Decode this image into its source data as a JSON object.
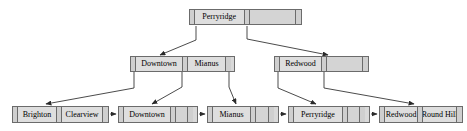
{
  "diagram": {
    "type": "b-plus-tree",
    "width": 467,
    "height": 131,
    "colors": {
      "node_fill": "#d9d9d9",
      "key_fill": "#dedede",
      "pointer_fill": "#cfcfcf",
      "border": "#6b6b6b",
      "edge": "#333333",
      "background": "#ffffff"
    }
  },
  "levels": {
    "root_label": "root",
    "internal_label": "internal",
    "leaf_label": "leaf"
  },
  "nodes": {
    "root": {
      "id": "root",
      "level": "root",
      "x": 189,
      "y": 9,
      "width": 113,
      "height": 16,
      "cells": [
        {
          "kind": "ptr",
          "text": ""
        },
        {
          "kind": "key",
          "text": "Perryridge",
          "width": 50
        },
        {
          "kind": "ptr",
          "text": ""
        },
        {
          "kind": "empty",
          "text": "",
          "width": 47
        },
        {
          "kind": "ptr",
          "text": ""
        }
      ]
    },
    "internal_left": {
      "id": "internal_left",
      "level": "internal",
      "x": 130,
      "y": 56,
      "width": 105,
      "height": 16,
      "cells": [
        {
          "kind": "ptr",
          "text": ""
        },
        {
          "kind": "key",
          "text": "Downtown",
          "width": 47
        },
        {
          "kind": "ptr",
          "text": ""
        },
        {
          "kind": "key",
          "text": "Mianus",
          "width": 38
        },
        {
          "kind": "ptr",
          "text": ""
        }
      ]
    },
    "internal_right": {
      "id": "internal_right",
      "level": "internal",
      "x": 274,
      "y": 56,
      "width": 95,
      "height": 16,
      "cells": [
        {
          "kind": "ptr",
          "text": ""
        },
        {
          "kind": "key",
          "text": "Redwood",
          "width": 43
        },
        {
          "kind": "ptr",
          "text": ""
        },
        {
          "kind": "empty",
          "text": "",
          "width": 37
        },
        {
          "kind": "ptr",
          "text": ""
        }
      ]
    },
    "leaf1": {
      "id": "leaf1",
      "level": "leaf",
      "x": 12,
      "y": 106,
      "width": 97,
      "height": 17,
      "cells": [
        {
          "kind": "ptr",
          "text": ""
        },
        {
          "kind": "key",
          "text": "Brighton",
          "width": 40
        },
        {
          "kind": "ptr",
          "text": ""
        },
        {
          "kind": "key",
          "text": "Clearview",
          "width": 42
        },
        {
          "kind": "ptr",
          "text": ""
        }
      ]
    },
    "leaf2": {
      "id": "leaf2",
      "level": "leaf",
      "x": 118,
      "y": 106,
      "width": 80,
      "height": 17,
      "cells": [
        {
          "kind": "ptr",
          "text": ""
        },
        {
          "kind": "key",
          "text": "Downtown",
          "width": 47
        },
        {
          "kind": "ptr",
          "text": ""
        },
        {
          "kind": "blank",
          "text": "",
          "width": 12
        },
        {
          "kind": "ptr",
          "text": ""
        }
      ]
    },
    "leaf3": {
      "id": "leaf3",
      "level": "leaf",
      "x": 207,
      "y": 106,
      "width": 72,
      "height": 17,
      "cells": [
        {
          "kind": "ptr",
          "text": ""
        },
        {
          "kind": "key",
          "text": "Mianus",
          "width": 38
        },
        {
          "kind": "ptr",
          "text": ""
        },
        {
          "kind": "blank",
          "text": "",
          "width": 13
        },
        {
          "kind": "ptr",
          "text": ""
        }
      ]
    },
    "leaf4": {
      "id": "leaf4",
      "level": "leaf",
      "x": 288,
      "y": 106,
      "width": 82,
      "height": 17,
      "cells": [
        {
          "kind": "ptr",
          "text": ""
        },
        {
          "kind": "key",
          "text": "Perryridge",
          "width": 49
        },
        {
          "kind": "ptr",
          "text": ""
        },
        {
          "kind": "blank",
          "text": "",
          "width": 12
        },
        {
          "kind": "ptr",
          "text": ""
        }
      ]
    },
    "leaf5": {
      "id": "leaf5",
      "level": "leaf",
      "x": 379,
      "y": 106,
      "width": 84,
      "height": 17,
      "cells": [
        {
          "kind": "ptr",
          "text": ""
        },
        {
          "kind": "key",
          "text": "Redwood",
          "width": 42
        },
        {
          "kind": "ptr",
          "text": ""
        },
        {
          "kind": "key",
          "text": "Round Hill",
          "width": 43
        },
        {
          "kind": "ptr",
          "text": ""
        }
      ]
    }
  },
  "edges": [
    {
      "name": "root-to-internal-left",
      "from": "root",
      "to": "internal_left",
      "path": "M 196 26 L 196 40 L 160 55",
      "arrow": [
        160,
        55,
        -68
      ]
    },
    {
      "name": "root-to-internal-right",
      "from": "root",
      "to": "internal_right",
      "path": "M 247 26 L 247 39 L 328 55",
      "arrow": [
        328,
        55,
        45
      ]
    },
    {
      "name": "internal-left-to-leaf1",
      "from": "internal_left",
      "to": "leaf1",
      "path": "M 134 72 L 134 88 L 46 104",
      "arrow": [
        46,
        104,
        -170
      ]
    },
    {
      "name": "internal-left-to-leaf2",
      "from": "internal_left",
      "to": "leaf2",
      "path": "M 182 72 L 182 87 L 152 104",
      "arrow": [
        152,
        104,
        -62
      ]
    },
    {
      "name": "internal-left-to-leaf3",
      "from": "internal_left",
      "to": "leaf3",
      "path": "M 229 72 L 229 87 L 236 104",
      "arrow": [
        236,
        104,
        14
      ]
    },
    {
      "name": "internal-right-to-leaf4",
      "from": "internal_right",
      "to": "leaf4",
      "path": "M 278 72 L 278 88 L 316 104",
      "arrow": [
        316,
        104,
        38
      ]
    },
    {
      "name": "internal-right-to-leaf5",
      "from": "internal_right",
      "to": "leaf5",
      "path": "M 324 72 L 324 88 L 414 104",
      "arrow": [
        414,
        104,
        90
      ]
    },
    {
      "name": "leaf1-to-leaf2",
      "from": "leaf1",
      "to": "leaf2",
      "path": "M 110 114 L 116 114",
      "arrow": [
        117,
        114,
        6
      ]
    },
    {
      "name": "leaf2-to-leaf3",
      "from": "leaf2",
      "to": "leaf3",
      "path": "M 199 114 L 205 114",
      "arrow": [
        206,
        114,
        6
      ]
    },
    {
      "name": "leaf3-to-leaf4",
      "from": "leaf3",
      "to": "leaf4",
      "path": "M 280 114 L 286 114",
      "arrow": [
        287,
        114,
        6
      ]
    },
    {
      "name": "leaf4-to-leaf5",
      "from": "leaf4",
      "to": "leaf5",
      "path": "M 371 114 L 377 114",
      "arrow": [
        378,
        114,
        6
      ]
    }
  ]
}
